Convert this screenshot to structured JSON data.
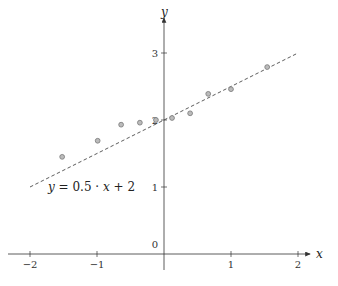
{
  "chart_data": {
    "type": "scatter",
    "title": "",
    "xlabel": "x",
    "ylabel": "y",
    "xlim": [
      -2.2,
      2.35
    ],
    "ylim": [
      -0.15,
      3.5
    ],
    "grid": false,
    "x_ticks": [
      -2,
      -1,
      1,
      2
    ],
    "x_tick_labels": [
      "−2",
      "−1",
      "1",
      "2"
    ],
    "y_ticks": [
      0,
      1,
      2,
      3
    ],
    "y_tick_labels": [
      "0",
      "1",
      "2",
      "3"
    ],
    "series": [
      {
        "name": "data points",
        "type": "scatter",
        "marker": "circle",
        "color": "#999999",
        "x": [
          -1.52,
          -0.99,
          -0.64,
          -0.36,
          -0.12,
          0.12,
          0.39,
          0.66,
          1.0,
          1.54
        ],
        "y": [
          1.45,
          1.69,
          1.93,
          1.96,
          2.0,
          2.03,
          2.1,
          2.39,
          2.46,
          2.79
        ]
      },
      {
        "name": "y = 0.5 · x + 2",
        "type": "line",
        "style": "dashed",
        "color": "#333333",
        "slope": 0.5,
        "intercept": 2,
        "x_range": [
          -2,
          2
        ]
      }
    ],
    "annotations": [
      {
        "text": "y = 0.5 · x + 2",
        "x": -1.3,
        "y": 0.93
      }
    ]
  },
  "labels": {
    "x_axis": "x",
    "y_axis": "y",
    "equation": "y = 0.5 · x + 2"
  }
}
